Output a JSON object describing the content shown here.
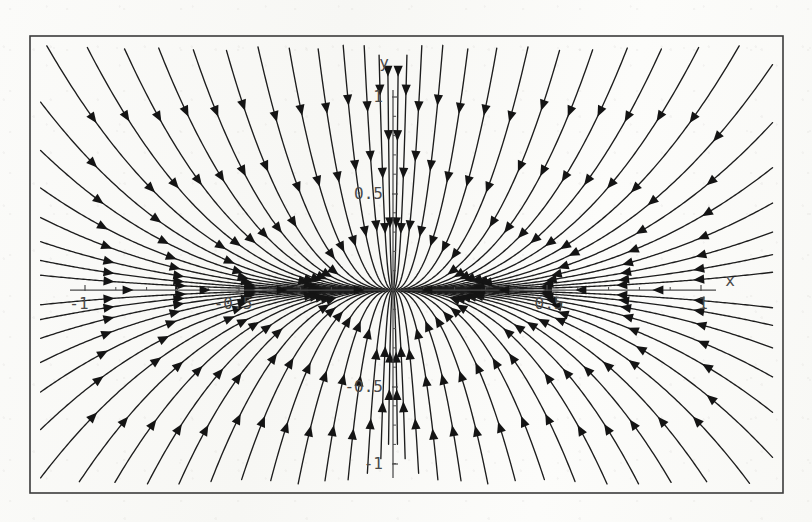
{
  "figure": {
    "kind": "phase-portrait",
    "frame": {
      "x": 30,
      "y": 36,
      "width": 753,
      "height": 457,
      "stroke": "#3b3b3b",
      "stroke_width": 1.6
    },
    "background_color": "#fbfbf9",
    "ink_color": "#1d1d1d",
    "axis_color": "#4a4a4a",
    "label_color": "#4a4a4a"
  },
  "chart_data": {
    "type": "line",
    "title": "",
    "subtitle": "",
    "xlabel": "x",
    "ylabel": "y",
    "xlim": [
      -1.05,
      1.05
    ],
    "ylim": [
      -1.25,
      1.25
    ],
    "grid": false,
    "legend": null,
    "annotations": [],
    "axes": {
      "x_axis": {
        "label": "x",
        "label_position": {
          "x": 730,
          "y": 286
        },
        "pixel_y": 290,
        "pixel_x_start": 70,
        "pixel_x_end": 716,
        "major_ticks": [
          {
            "value": -1,
            "label": "-1",
            "pixel_x": 85
          },
          {
            "value": -0.5,
            "label": "-0.5",
            "pixel_x": 239
          },
          {
            "value": 0.5,
            "label": "0.5",
            "pixel_x": 547
          },
          {
            "value": 1,
            "label": "1",
            "pixel_x": 701
          }
        ],
        "minor_tick_values": [
          -0.9,
          -0.8,
          -0.7,
          -0.6,
          -0.4,
          -0.3,
          -0.2,
          -0.1,
          0.1,
          0.2,
          0.3,
          0.4,
          0.6,
          0.7,
          0.8,
          0.9
        ],
        "tick_label_offset_y": 19,
        "arrow_marker_values": [
          -0.86,
          -0.61,
          -0.36,
          -0.11,
          0.11,
          0.36,
          0.61,
          0.86
        ],
        "arrow_direction": "toward-origin"
      },
      "y_axis": {
        "label": "y",
        "label_position": {
          "x": 384,
          "y": 68
        },
        "pixel_x": 393,
        "pixel_y_start": 90,
        "pixel_y_end": 478,
        "major_ticks": [
          {
            "value": 1,
            "label": "1",
            "pixel_y": 97
          },
          {
            "value": 0.5,
            "label": "0.5",
            "pixel_y": 194
          },
          {
            "value": -0.5,
            "label": "-0.5",
            "pixel_y": 387
          },
          {
            "value": -1,
            "label": "-1",
            "pixel_y": 464
          }
        ],
        "minor_tick_values": [
          0.9,
          0.8,
          0.7,
          0.6,
          0.4,
          0.3,
          0.2,
          0.1,
          -0.1,
          -0.2,
          -0.3,
          -0.4,
          -0.6,
          -0.7,
          -0.8,
          -0.9
        ],
        "tick_label_offset_x": -10
      }
    },
    "origin_pixel": {
      "x": 393,
      "y": 290
    },
    "scale_pixels_per_unit": {
      "x": 308,
      "y": 193
    },
    "equilibrium": {
      "x": 0,
      "y": 0,
      "type": "stable node",
      "label": ""
    },
    "trajectory_count": 40,
    "trajectory_family": {
      "model": "dx/dt = -x,  dy/dt = -k*y  (stable node, k>1)",
      "shape_exponent": 2.45,
      "note": "Curves y = C*|x|^p enter the origin tangent to the x-axis; the steepest members run nearly vertical far from the origin."
    },
    "trajectories_upper_right": [
      0.055,
      0.11,
      0.18,
      0.27,
      0.38,
      0.52,
      0.7,
      0.95,
      1.28,
      1.75,
      2.45,
      3.6,
      5.6,
      9.5,
      18.0,
      40.0,
      110.0,
      420.0,
      2400.0,
      26000.0
    ],
    "trajectories_upper_left": [
      0.055,
      0.11,
      0.18,
      0.27,
      0.38,
      0.52,
      0.7,
      0.95,
      1.28,
      1.75,
      2.45,
      3.6,
      5.6,
      9.5,
      18.0,
      40.0,
      110.0,
      420.0,
      2400.0,
      26000.0
    ],
    "arrow_head": {
      "length": 11,
      "half_width": 4.6,
      "fill": "#141414"
    }
  },
  "labels": {
    "x_axis": "x",
    "y_axis": "y",
    "x_pos_1": "1",
    "x_pos_half": "0.5",
    "x_neg_half": "-0.5",
    "x_neg_1": "-1",
    "y_pos_1": "1",
    "y_pos_half": "0.5",
    "y_neg_half": "-0.5",
    "y_neg_1": "-1"
  }
}
